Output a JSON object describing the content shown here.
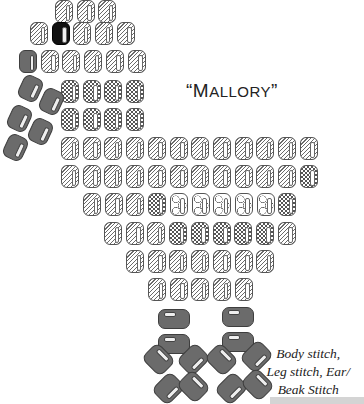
{
  "title": {
    "open_quote": "“",
    "first_letter": "M",
    "rest": "ALLORY",
    "close_quote": "”",
    "full": "“Mallory”"
  },
  "caption": {
    "lines": [
      "Body stitch,",
      "Leg stitch, Ear/",
      "Beak Stitch"
    ]
  },
  "legend_patterns": {
    "hatch": "diagonal-hatched bead",
    "check": "checkered bead",
    "circle": "circle-pattern bead",
    "black": "black bead (eye)",
    "gray": "solid gray bead (beak / legs)"
  },
  "colors": {
    "gray_bead": "#6b6b6b",
    "black_bead": "#111111",
    "outline": "#555555"
  },
  "body_rows": [
    {
      "x": 55,
      "y": 0,
      "beads": [
        "hatch",
        "hatch",
        "hatch"
      ]
    },
    {
      "x": 30,
      "y": 22,
      "beads": [
        "hatch",
        "black",
        "hatch",
        "hatch",
        "hatch"
      ]
    },
    {
      "x": 19,
      "y": 50,
      "beads": [
        "gray",
        "hatch",
        "hatch",
        "hatch",
        "hatch",
        "hatch"
      ]
    },
    {
      "x": 61,
      "y": 80,
      "beads": [
        "check",
        "check",
        "check",
        "check"
      ]
    },
    {
      "x": 61,
      "y": 108,
      "beads": [
        "check",
        "check",
        "check",
        "check"
      ]
    },
    {
      "x": 61,
      "y": 137,
      "beads": [
        "hatch",
        "hatch",
        "hatch",
        "hatch",
        "hatch",
        "hatch",
        "hatch",
        "hatch",
        "hatch",
        "hatch",
        "hatch",
        "hatch"
      ]
    },
    {
      "x": 61,
      "y": 165,
      "beads": [
        "hatch",
        "hatch",
        "hatch",
        "hatch",
        "hatch",
        "hatch",
        "hatch",
        "hatch",
        "hatch",
        "hatch",
        "hatch",
        "check"
      ]
    },
    {
      "x": 83,
      "y": 193,
      "beads": [
        "hatch",
        "hatch",
        "hatch",
        "check",
        "circle",
        "circle",
        "circle",
        "circle",
        "circle",
        "check"
      ]
    },
    {
      "x": 104,
      "y": 222,
      "beads": [
        "hatch",
        "hatch",
        "hatch",
        "check",
        "check",
        "check",
        "check",
        "check",
        "hatch"
      ]
    },
    {
      "x": 126,
      "y": 250,
      "beads": [
        "hatch",
        "hatch",
        "hatch",
        "hatch",
        "hatch",
        "hatch",
        "hatch"
      ]
    },
    {
      "x": 148,
      "y": 278,
      "beads": [
        "hatch",
        "hatch",
        "hatch",
        "hatch",
        "hatch"
      ]
    }
  ],
  "beak_beads": [
    {
      "x": 20,
      "y": 76,
      "rot": 25
    },
    {
      "x": 41,
      "y": 89,
      "rot": 25
    },
    {
      "x": 9,
      "y": 106,
      "rot": 25
    },
    {
      "x": 30,
      "y": 119,
      "rot": 25
    },
    {
      "x": 5,
      "y": 135,
      "rot": 25
    }
  ],
  "leg_beads": [
    {
      "x": 158,
      "y": 309
    },
    {
      "x": 158,
      "y": 334
    },
    {
      "x": 222,
      "y": 307
    },
    {
      "x": 222,
      "y": 332
    }
  ],
  "foot_beads": [
    {
      "x": 147,
      "y": 346,
      "rot": -45
    },
    {
      "x": 182,
      "y": 346,
      "rot": 45
    },
    {
      "x": 157,
      "y": 375,
      "rot": 45
    },
    {
      "x": 182,
      "y": 373,
      "rot": -45
    },
    {
      "x": 210,
      "y": 346,
      "rot": -45
    },
    {
      "x": 245,
      "y": 343,
      "rot": 45
    },
    {
      "x": 220,
      "y": 375,
      "rot": 45
    },
    {
      "x": 246,
      "y": 371,
      "rot": -45
    }
  ],
  "bead_pitch_x": 21.7
}
